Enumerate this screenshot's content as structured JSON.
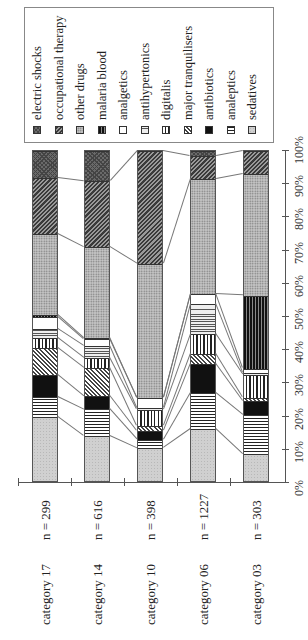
{
  "chart_data": {
    "type": "bar",
    "stacked": true,
    "normalized_100": true,
    "orientation_note": "figure rotated 90 degrees counter-clockwise",
    "title": "",
    "xlabel": "",
    "ylabel": "",
    "ylim": [
      0,
      100
    ],
    "y_ticks": [
      "0%",
      "10%",
      "20%",
      "30%",
      "40%",
      "50%",
      "60%",
      "70%",
      "80%",
      "90%",
      "100%"
    ],
    "categories": [
      "category 17",
      "category 14",
      "category 10",
      "category 06",
      "category 03"
    ],
    "category_n": [
      "n = 299",
      "n = 616",
      "n = 398",
      "n = 1227",
      "n = 303"
    ],
    "legend_position": "top-right (rotated)",
    "legend_order": [
      "electric shocks",
      "occupational therapy",
      "other drugs",
      "malaria blood",
      "analgetics",
      "antihypertonics",
      "digitalis",
      "major tranquilisers",
      "antibiotics",
      "analeptics",
      "sedatives"
    ],
    "series": [
      {
        "name": "sedatives",
        "fill": "#cfcfcf",
        "pattern": "light",
        "values": [
          20.0,
          14.2,
          10.5,
          16.2,
          8.6
        ]
      },
      {
        "name": "analeptics",
        "fill": "#ffffff",
        "pattern": "hstripes",
        "values": [
          6.0,
          8.0,
          2.6,
          11.0,
          12.0
        ]
      },
      {
        "name": "antibiotics",
        "fill": "#111111",
        "pattern": "solid",
        "values": [
          6.6,
          4.0,
          2.5,
          8.6,
          4.0
        ]
      },
      {
        "name": "major tranquilisers",
        "fill": "#777777",
        "pattern": "diag",
        "values": [
          8.1,
          8.5,
          1.5,
          3.0,
          1.0
        ]
      },
      {
        "name": "digitalis",
        "fill": "#ffffff",
        "pattern": "vstripes",
        "values": [
          3.0,
          3.0,
          5.0,
          6.0,
          7.0
        ]
      },
      {
        "name": "antihypertonics",
        "fill": "#bdbdbd",
        "pattern": "hlines",
        "values": [
          2.7,
          3.6,
          0.5,
          9.0,
          0.4
        ]
      },
      {
        "name": "analgetics",
        "fill": "#ffffff",
        "pattern": "white",
        "values": [
          3.7,
          2.0,
          3.0,
          3.0,
          1.3
        ]
      },
      {
        "name": "malaria blood",
        "fill": "#222222",
        "pattern": "darkvlines",
        "values": [
          0.5,
          0.3,
          0.0,
          0.0,
          22.1
        ]
      },
      {
        "name": "other drugs",
        "fill": "#b5b5b5",
        "pattern": "dots",
        "values": [
          24.4,
          27.4,
          40.4,
          34.7,
          36.6
        ]
      },
      {
        "name": "occupational therapy",
        "fill": "#555555",
        "pattern": "diagdark",
        "values": [
          17.0,
          20.0,
          34.0,
          7.0,
          7.0
        ]
      },
      {
        "name": "electric shocks",
        "fill": "#666666",
        "pattern": "crosshatch",
        "values": [
          8.0,
          9.0,
          0.0,
          1.5,
          0.0
        ]
      }
    ]
  },
  "axis": {
    "ticks": [
      "0%",
      "10%",
      "20%",
      "30%",
      "40%",
      "50%",
      "60%",
      "70%",
      "80%",
      "90%",
      "100%"
    ]
  },
  "categories": [
    {
      "label": "category 17",
      "n": "n = 299"
    },
    {
      "label": "category 14",
      "n": "n = 616"
    },
    {
      "label": "category 10",
      "n": "n = 398"
    },
    {
      "label": "category 06",
      "n": "n = 1227"
    },
    {
      "label": "category 03",
      "n": "n = 303"
    }
  ],
  "legend": {
    "items": [
      {
        "label": "electric shocks"
      },
      {
        "label": "occupational therapy"
      },
      {
        "label": "other drugs"
      },
      {
        "label": "malaria blood"
      },
      {
        "label": "analgetics"
      },
      {
        "label": "antihypertonics"
      },
      {
        "label": "digitalis"
      },
      {
        "label": "major tranquilisers"
      },
      {
        "label": "antibiotics"
      },
      {
        "label": "analeptics"
      },
      {
        "label": "sedatives"
      }
    ]
  }
}
